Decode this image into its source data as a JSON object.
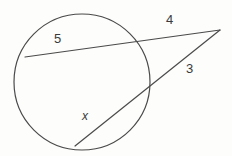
{
  "figure": {
    "background_color": "#fdfdfc",
    "stroke_color": "#4a4a4a",
    "label_color": "#3a3a3a",
    "circle": {
      "center_x": 82,
      "center_y": 82,
      "radius": 68
    },
    "external_point": {
      "x": 220,
      "y": 30
    },
    "secant_upper": {
      "near_intersection_x": 132,
      "near_intersection_y": 44,
      "far_intersection_x": 25,
      "far_intersection_y": 57,
      "chord_label": "5",
      "external_label": "4"
    },
    "secant_lower": {
      "near_intersection_x": 145,
      "near_intersection_y": 92,
      "far_intersection_x": 75,
      "far_intersection_y": 146,
      "chord_label": "x",
      "external_label": "3"
    }
  },
  "labels": {
    "chord_upper": "5",
    "external_upper": "4",
    "external_lower": "3",
    "chord_lower": "x"
  }
}
